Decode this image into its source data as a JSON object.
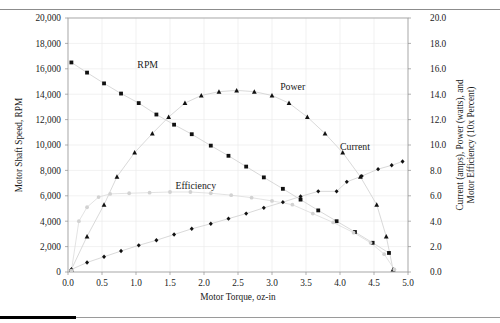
{
  "figure": {
    "background_color": "#ffffff",
    "marker_color": "#111111",
    "efficiency_color": "#d2d2d2",
    "line_color": "#c9c9c9",
    "grid_color": "#e8e8e8"
  },
  "chart_data": {
    "type": "scatter",
    "title": "",
    "xlabel": "Motor Torque, oz-in",
    "ylabel": "Motor Shaft Speed, RPM",
    "ylabel_right": "Current (amps), Power (watts), and Motor Efficiency (10x Percent)",
    "xlim": [
      0.0,
      5.0
    ],
    "ylim": [
      0,
      20000
    ],
    "ylim_right": [
      0.0,
      20.0
    ],
    "xticks": [
      0.0,
      0.5,
      1.0,
      1.5,
      2.0,
      2.5,
      3.0,
      3.5,
      4.0,
      4.5,
      5.0
    ],
    "xticklabels": [
      "0.0",
      "0.5",
      "1.0",
      "1.5",
      "2.0",
      "2.5",
      "3.0",
      "3.5",
      "4.0",
      "4.5",
      "5.0"
    ],
    "yticks": [
      0,
      2000,
      4000,
      6000,
      8000,
      10000,
      12000,
      14000,
      16000,
      18000,
      20000
    ],
    "yticklabels": [
      "0",
      "2,000",
      "4,000",
      "6,000",
      "8,000",
      "10,000",
      "12,000",
      "14,000",
      "16,000",
      "18,000",
      "20,000"
    ],
    "yticks_right": [
      0.0,
      2.0,
      4.0,
      6.0,
      8.0,
      10.0,
      12.0,
      14.0,
      16.0,
      18.0,
      20.0
    ],
    "yticklabels_right": [
      "0.0",
      "2.0",
      "4.0",
      "6.0",
      "8.0",
      "10.0",
      "12.0",
      "14.0",
      "16.0",
      "18.0",
      "20.0"
    ],
    "grid": true,
    "legend": "inline-annotations",
    "series": [
      {
        "name": "RPM",
        "axis": "left",
        "marker": "square",
        "label_x": 1.02,
        "label_y": 16100,
        "points": [
          {
            "x": 0.05,
            "y": 16500
          },
          {
            "x": 0.28,
            "y": 15700
          },
          {
            "x": 0.53,
            "y": 14850
          },
          {
            "x": 0.78,
            "y": 14050
          },
          {
            "x": 1.04,
            "y": 13300
          },
          {
            "x": 1.3,
            "y": 12400
          },
          {
            "x": 1.56,
            "y": 11600
          },
          {
            "x": 1.82,
            "y": 10850
          },
          {
            "x": 2.1,
            "y": 9950
          },
          {
            "x": 2.36,
            "y": 9150
          },
          {
            "x": 2.62,
            "y": 8300
          },
          {
            "x": 2.88,
            "y": 7450
          },
          {
            "x": 3.16,
            "y": 6550
          },
          {
            "x": 3.42,
            "y": 5700
          },
          {
            "x": 3.68,
            "y": 4850
          },
          {
            "x": 3.95,
            "y": 4000
          },
          {
            "x": 4.22,
            "y": 3150
          },
          {
            "x": 4.48,
            "y": 2300
          },
          {
            "x": 4.72,
            "y": 1500
          }
        ]
      },
      {
        "name": "Power",
        "axis": "right",
        "marker": "triangle",
        "label_x": 3.12,
        "label_y_right": 14.3,
        "points": [
          {
            "x": 0.05,
            "y": 0.2
          },
          {
            "x": 0.28,
            "y": 2.8
          },
          {
            "x": 0.53,
            "y": 5.3
          },
          {
            "x": 0.72,
            "y": 7.5
          },
          {
            "x": 0.98,
            "y": 9.4
          },
          {
            "x": 1.24,
            "y": 10.9
          },
          {
            "x": 1.48,
            "y": 12.2
          },
          {
            "x": 1.72,
            "y": 13.3
          },
          {
            "x": 1.96,
            "y": 13.9
          },
          {
            "x": 2.22,
            "y": 14.2
          },
          {
            "x": 2.48,
            "y": 14.3
          },
          {
            "x": 2.74,
            "y": 14.2
          },
          {
            "x": 3.0,
            "y": 13.9
          },
          {
            "x": 3.25,
            "y": 13.3
          },
          {
            "x": 3.52,
            "y": 12.2
          },
          {
            "x": 3.78,
            "y": 10.9
          },
          {
            "x": 4.04,
            "y": 9.4
          },
          {
            "x": 4.3,
            "y": 7.5
          },
          {
            "x": 4.54,
            "y": 5.3
          },
          {
            "x": 4.68,
            "y": 2.8
          },
          {
            "x": 4.78,
            "y": 0.2
          }
        ]
      },
      {
        "name": "Current",
        "axis": "right",
        "marker": "diamond",
        "label_x": 4.0,
        "label_y_right": 9.6,
        "points": [
          {
            "x": 0.05,
            "y": 0.2
          },
          {
            "x": 0.28,
            "y": 0.75
          },
          {
            "x": 0.53,
            "y": 1.2
          },
          {
            "x": 0.78,
            "y": 1.65
          },
          {
            "x": 1.04,
            "y": 2.1
          },
          {
            "x": 1.3,
            "y": 2.5
          },
          {
            "x": 1.56,
            "y": 2.95
          },
          {
            "x": 1.82,
            "y": 3.4
          },
          {
            "x": 2.1,
            "y": 3.8
          },
          {
            "x": 2.36,
            "y": 4.2
          },
          {
            "x": 2.62,
            "y": 4.6
          },
          {
            "x": 2.88,
            "y": 5.05
          },
          {
            "x": 3.16,
            "y": 5.5
          },
          {
            "x": 3.42,
            "y": 5.95
          },
          {
            "x": 3.68,
            "y": 6.35
          },
          {
            "x": 3.95,
            "y": 6.35
          },
          {
            "x": 4.1,
            "y": 7.1
          },
          {
            "x": 4.32,
            "y": 7.55
          },
          {
            "x": 4.56,
            "y": 8.1
          },
          {
            "x": 4.76,
            "y": 8.4
          },
          {
            "x": 4.92,
            "y": 8.7
          }
        ]
      },
      {
        "name": "Efficiency",
        "axis": "right",
        "marker": "dot",
        "label_x": 1.58,
        "label_y_right": 6.55,
        "points": [
          {
            "x": 0.05,
            "y": 0.1
          },
          {
            "x": 0.16,
            "y": 4.0
          },
          {
            "x": 0.28,
            "y": 5.1
          },
          {
            "x": 0.45,
            "y": 5.9
          },
          {
            "x": 0.62,
            "y": 6.15
          },
          {
            "x": 0.9,
            "y": 6.2
          },
          {
            "x": 1.2,
            "y": 6.25
          },
          {
            "x": 1.5,
            "y": 6.3
          },
          {
            "x": 1.8,
            "y": 6.3
          },
          {
            "x": 2.1,
            "y": 6.2
          },
          {
            "x": 2.4,
            "y": 6.05
          },
          {
            "x": 2.7,
            "y": 5.85
          },
          {
            "x": 3.0,
            "y": 5.6
          },
          {
            "x": 3.3,
            "y": 5.3
          },
          {
            "x": 3.6,
            "y": 4.6
          },
          {
            "x": 3.9,
            "y": 3.9
          },
          {
            "x": 4.2,
            "y": 3.1
          },
          {
            "x": 4.45,
            "y": 2.3
          },
          {
            "x": 4.65,
            "y": 1.4
          },
          {
            "x": 4.8,
            "y": 0.2
          }
        ]
      }
    ]
  }
}
